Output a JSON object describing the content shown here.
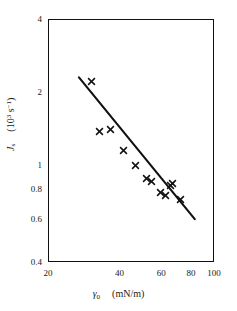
{
  "figure": {
    "background": "#ffffff",
    "ink_color": "#111111"
  },
  "chart_data": {
    "type": "scatter",
    "title": "",
    "xlabel": "γ₀  (mN/m)",
    "ylabel": "Jₛ  (10³ s⁻¹)",
    "xscale": "log",
    "yscale": "log",
    "xlim": [
      20,
      100
    ],
    "ylim": [
      0.4,
      4
    ],
    "grid": false,
    "legend": null,
    "xticks": [
      20,
      30,
      40,
      50,
      60,
      70,
      80,
      90,
      100
    ],
    "xticklabels": [
      "20",
      "",
      "40",
      "",
      "60",
      "",
      "80",
      "",
      "100"
    ],
    "yticks": [
      0.4,
      0.5,
      0.6,
      0.7,
      0.8,
      0.9,
      1,
      2,
      3,
      4
    ],
    "yticklabels": [
      "0.4",
      "",
      "0.6",
      "",
      "0.8",
      "",
      "1",
      "2",
      "",
      "4"
    ],
    "marker": "x",
    "points": [
      {
        "x": 30.5,
        "y": 2.22
      },
      {
        "x": 33.0,
        "y": 1.38
      },
      {
        "x": 36.5,
        "y": 1.4
      },
      {
        "x": 41.5,
        "y": 1.15
      },
      {
        "x": 46.5,
        "y": 1.0
      },
      {
        "x": 52.0,
        "y": 0.885
      },
      {
        "x": 54.5,
        "y": 0.855
      },
      {
        "x": 59.5,
        "y": 0.775
      },
      {
        "x": 62.5,
        "y": 0.748
      },
      {
        "x": 65.5,
        "y": 0.828
      },
      {
        "x": 67.0,
        "y": 0.845
      },
      {
        "x": 72.0,
        "y": 0.725
      }
    ],
    "fit_line": {
      "x_start": 27.0,
      "y_start": 2.3,
      "x_end": 83.0,
      "y_end": 0.6
    }
  },
  "axes": {
    "x_title": "γ",
    "x_title_sub": "0",
    "x_title_unit": "(mN/m)",
    "y_title": "J",
    "y_title_sub": "s",
    "y_title_unit_pre": "(10",
    "y_title_unit_exp": "3",
    "y_title_unit_post": " s",
    "y_title_unit_exp2": "−1",
    "y_title_unit_close": ")"
  }
}
